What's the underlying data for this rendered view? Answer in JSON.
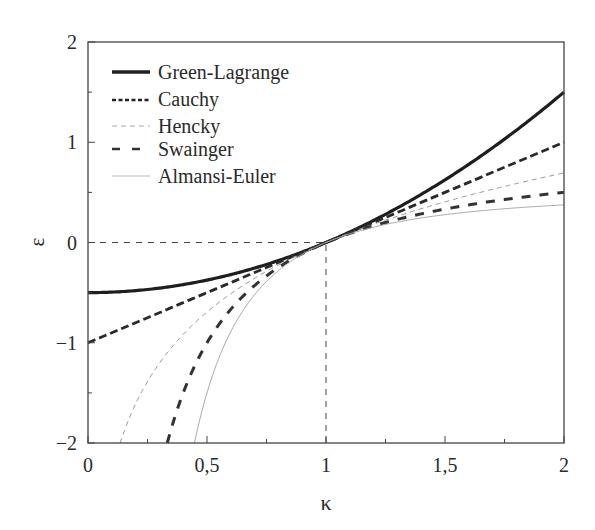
{
  "chart_data": {
    "type": "line",
    "title": "",
    "xlabel": "κ",
    "ylabel": "ε",
    "xlim": [
      0,
      2
    ],
    "ylim": [
      -2,
      2
    ],
    "grid": false,
    "legend_position": "upper left",
    "x_ticks": [
      {
        "value": 0,
        "label": "0"
      },
      {
        "value": 0.5,
        "label": "0,5"
      },
      {
        "value": 1,
        "label": "1"
      },
      {
        "value": 1.5,
        "label": "1,5"
      },
      {
        "value": 2,
        "label": "2"
      }
    ],
    "x_minor_ticks": [
      0.25,
      0.75,
      1.25,
      1.75
    ],
    "y_ticks": [
      {
        "value": 2,
        "label": "2"
      },
      {
        "value": 1,
        "label": "1"
      },
      {
        "value": 0,
        "label": "0"
      },
      {
        "value": -1,
        "label": "−1"
      },
      {
        "value": -2,
        "label": "−2"
      }
    ],
    "y_minor_ticks": [
      1.5,
      0.5,
      -0.5,
      -1.5
    ],
    "reference_lines": [
      {
        "orientation": "horizontal",
        "y": 0,
        "x_from": 0,
        "x_to": 1,
        "style": "dashed"
      },
      {
        "orientation": "vertical",
        "x": 1,
        "y_from": -2,
        "y_to": 0,
        "style": "dashed"
      }
    ],
    "series": [
      {
        "name": "Green-Lagrange",
        "formula": "(κ²−1)/2",
        "style": "solid-thick",
        "x": [
          0,
          0.25,
          0.5,
          0.75,
          1,
          1.25,
          1.5,
          1.75,
          2
        ],
        "values": [
          -0.5,
          -0.469,
          -0.375,
          -0.219,
          0,
          0.281,
          0.625,
          1.031,
          1.5
        ]
      },
      {
        "name": "Cauchy",
        "formula": "κ−1",
        "style": "dashed-thick-short",
        "x": [
          0,
          0.25,
          0.5,
          0.75,
          1,
          1.25,
          1.5,
          1.75,
          2
        ],
        "values": [
          -1,
          -0.75,
          -0.5,
          -0.25,
          0,
          0.25,
          0.5,
          0.75,
          1
        ]
      },
      {
        "name": "Hencky",
        "formula": "ln κ",
        "style": "dashed-thin-light",
        "x": [
          0.135,
          0.25,
          0.5,
          0.75,
          1,
          1.25,
          1.5,
          1.75,
          2
        ],
        "values": [
          -2,
          -1.386,
          -0.693,
          -0.288,
          0,
          0.223,
          0.405,
          0.56,
          0.693
        ]
      },
      {
        "name": "Swainger",
        "formula": "1−1/κ",
        "style": "dashed-thick-long",
        "x": [
          0.333,
          0.5,
          0.75,
          1,
          1.25,
          1.5,
          1.75,
          2
        ],
        "values": [
          -2,
          -1,
          -0.333,
          0,
          0.2,
          0.333,
          0.429,
          0.5
        ]
      },
      {
        "name": "Almansi-Euler",
        "formula": "(1−1/κ²)/2",
        "style": "solid-thin-light",
        "x": [
          0.447,
          0.5,
          0.75,
          1,
          1.25,
          1.5,
          1.75,
          2
        ],
        "values": [
          -2,
          -1.5,
          -0.389,
          0,
          0.18,
          0.278,
          0.337,
          0.375
        ]
      }
    ]
  },
  "legend": {
    "items": [
      {
        "label": "Green-Lagrange"
      },
      {
        "label": "Cauchy"
      },
      {
        "label": "Hencky"
      },
      {
        "label": "Swainger"
      },
      {
        "label": "Almansi-Euler"
      }
    ]
  }
}
